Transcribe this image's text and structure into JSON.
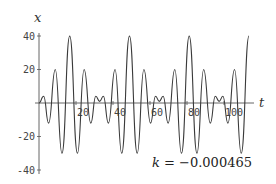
{
  "chart_data": {
    "type": "line",
    "title": "",
    "xlabel": "t",
    "ylabel": "x",
    "xlim": [
      0,
      116
    ],
    "ylim": [
      -42,
      42
    ],
    "grid": false,
    "legend": null,
    "x_ticks": [
      20,
      40,
      60,
      80,
      100
    ],
    "y_ticks": [
      -40,
      -20,
      20,
      40
    ],
    "x_tick_labels": [
      "20",
      "40",
      "60",
      "80",
      "100"
    ],
    "y_tick_labels": [
      "-40",
      "-20",
      "20",
      "40"
    ],
    "annotation": {
      "var": "k",
      "text": " = −0.000465"
    },
    "series": [
      {
        "name": "x(t)",
        "color": "#3a3a3a",
        "t": [
          0,
          2.5,
          5.2,
          8.8,
          12.4,
          16.6,
          20.8,
          24.4,
          28.0,
          30.7,
          32.75,
          34.8,
          37.5,
          41.1,
          44.7,
          48.9,
          53.1,
          56.7,
          60.3,
          63.0,
          65.05,
          67.1,
          69.8,
          73.4,
          77.0,
          81.2,
          85.4,
          89.0,
          92.6,
          95.3,
          97.35,
          99.4,
          102.1,
          105.7,
          109.3,
          113.5
        ],
        "x": [
          0,
          4,
          -12,
          20,
          -30,
          40,
          -30,
          20,
          -12,
          4,
          1,
          4,
          -12,
          20,
          -30,
          40,
          -30,
          20,
          -12,
          4,
          1,
          4,
          -12,
          20,
          -30,
          40,
          -30,
          20,
          -12,
          4,
          1,
          4,
          -12,
          20,
          -30,
          40
        ]
      }
    ]
  },
  "labels": {
    "x_axis": "t",
    "y_axis": "x",
    "k_var": "k",
    "k_value": " = −0.000465"
  }
}
